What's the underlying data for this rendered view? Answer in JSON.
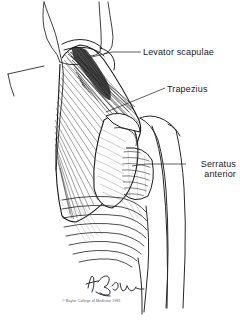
{
  "figure": {
    "name": "posterior-shoulder-musculature-illustration",
    "style": "pen-and-ink medical illustration",
    "background_color": "#ffffff",
    "ink_color": "#1a1a1a",
    "labels": [
      {
        "id": "levator-scapulae",
        "text": "Levator scapulae",
        "lines": [
          "Levator scapulae"
        ]
      },
      {
        "id": "trapezius",
        "text": "Trapezius",
        "lines": [
          "Trapezius"
        ]
      },
      {
        "id": "serratus-anterior",
        "text": "Serratus anterior",
        "lines": [
          "Serratus",
          "anterior"
        ]
      }
    ],
    "credit": {
      "copyright_line": "© Baylor College of Medicine 1981",
      "signature": "artist-signature"
    }
  }
}
